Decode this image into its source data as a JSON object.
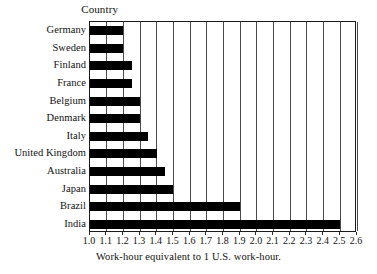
{
  "figure": {
    "header_label": "Country",
    "caption": "Work-hour equivalent to 1 U.S. work-hour."
  },
  "chart_data": {
    "type": "bar",
    "orientation": "horizontal",
    "title": "",
    "subtitle": "",
    "xlabel": "Work-hour equivalent to 1 U.S. work-hour.",
    "ylabel": "Country",
    "xlim": [
      1.0,
      2.6
    ],
    "grid": true,
    "grid_axis": "x",
    "legend": false,
    "legend_position": "none",
    "bar_color": "#000000",
    "frame_color": "#1a1a1a",
    "gridline_color": "#4a4a4a",
    "background": "#ffffff",
    "categories": [
      "Germany",
      "Sweden",
      "Finland",
      "France",
      "Belgium",
      "Denmark",
      "Italy",
      "United Kingdom",
      "Australia",
      "Japan",
      "Brazil",
      "India"
    ],
    "values": [
      1.2,
      1.2,
      1.25,
      1.25,
      1.3,
      1.3,
      1.35,
      1.4,
      1.45,
      1.5,
      1.9,
      2.5
    ],
    "tick_labels": [
      "1.0",
      "1.1",
      "1.2",
      "1.3",
      "1.4",
      "1.5",
      "1.6",
      "1.7",
      "1.8",
      "1.9",
      "2.0",
      "2.1",
      "2.2",
      "2.3",
      "2.4",
      "2.5",
      "2.6"
    ],
    "tick_values": [
      1.0,
      1.1,
      1.2,
      1.3,
      1.4,
      1.5,
      1.6,
      1.7,
      1.8,
      1.9,
      2.0,
      2.1,
      2.2,
      2.3,
      2.4,
      2.5,
      2.6
    ]
  }
}
